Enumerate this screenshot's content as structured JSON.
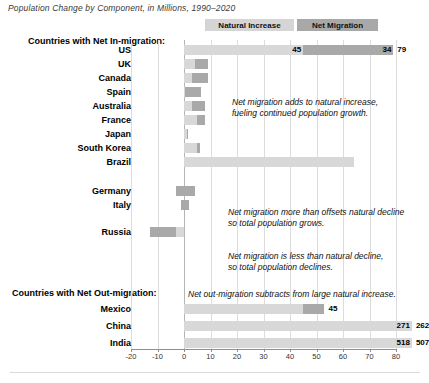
{
  "title": "Population Change by Component, in Millions, 1990–2020",
  "legend": {
    "natural_label": "Natural Increase",
    "migration_label": "Net Migration",
    "natural_color": "#d8d8d8",
    "migration_color": "#a9a9a9"
  },
  "groups": {
    "in_migration_header": "Countries with Net In-migration:",
    "out_migration_header": "Countries with Net Out-migration:"
  },
  "annotations": [
    {
      "line1": "Net migration adds to natural increase,",
      "line2": "fueling continued population growth."
    },
    {
      "line1": "Net migration more than offsets natural decline",
      "line2": "so total population grows."
    },
    {
      "line1": "Net migration is less than natural decline,",
      "line2": "so total population declines."
    },
    {
      "line1": "Net out-migration subtracts from large natural increase.",
      "line2": ""
    }
  ],
  "axis": {
    "ticks": [
      "-20",
      "-10",
      "0",
      "10",
      "20",
      "30",
      "40",
      "50",
      "60",
      "70",
      "80"
    ],
    "min": -20,
    "max": 80
  },
  "chart_data": {
    "type": "bar",
    "title": "Population Change by Component, in Millions, 1990–2020",
    "xlabel": "",
    "ylabel": "",
    "xlim": [
      -20,
      80
    ],
    "grid": true,
    "legend_position": "top",
    "orientation": "horizontal",
    "stacked": true,
    "series": [
      {
        "name": "Natural Increase",
        "color": "#d8d8d8"
      },
      {
        "name": "Net Migration",
        "color": "#a9a9a9"
      }
    ],
    "categories": [
      "US",
      "UK",
      "Canada",
      "Spain",
      "Australia",
      "France",
      "Japan",
      "South Korea",
      "Brazil",
      "Germany",
      "Italy",
      "Russia",
      "Mexico",
      "China",
      "India"
    ],
    "rows": [
      {
        "label": "US",
        "natural": 45,
        "migration": 34,
        "total": 79,
        "natural_label": "45",
        "migration_label": "34",
        "total_label": "79",
        "show_labels": true
      },
      {
        "label": "UK",
        "natural": 4,
        "migration": 5,
        "total": 9,
        "natural_label": "",
        "migration_label": "",
        "total_label": "",
        "show_labels": false
      },
      {
        "label": "Canada",
        "natural": 3,
        "migration": 6,
        "total": 9,
        "natural_label": "",
        "migration_label": "",
        "total_label": "",
        "show_labels": false
      },
      {
        "label": "Spain",
        "natural": 0.5,
        "migration": 6,
        "total": 6.5,
        "natural_label": "",
        "migration_label": "",
        "total_label": "",
        "show_labels": false
      },
      {
        "label": "Australia",
        "natural": 3,
        "migration": 5,
        "total": 8,
        "natural_label": "",
        "migration_label": "",
        "total_label": "",
        "show_labels": false
      },
      {
        "label": "France",
        "natural": 5,
        "migration": 3,
        "total": 8,
        "natural_label": "",
        "migration_label": "",
        "total_label": "",
        "show_labels": false
      },
      {
        "label": "Japan",
        "natural": 1,
        "migration": 0.4,
        "total": 1.4,
        "natural_label": "",
        "migration_label": "",
        "total_label": "",
        "show_labels": false
      },
      {
        "label": "South Korea",
        "natural": 5,
        "migration": 1,
        "total": 6,
        "natural_label": "",
        "migration_label": "",
        "total_label": "",
        "show_labels": false
      },
      {
        "label": "Brazil",
        "natural": 64,
        "migration": 0,
        "total": 64,
        "natural_label": "",
        "migration_label": "",
        "total_label": "",
        "show_labels": false
      },
      {
        "label": "Germany",
        "natural": -3,
        "migration": 7,
        "total": 4,
        "natural_label": "",
        "migration_label": "",
        "total_label": "",
        "show_labels": false
      },
      {
        "label": "Italy",
        "natural": -1,
        "migration": 3,
        "total": 2,
        "natural_label": "",
        "migration_label": "",
        "total_label": "",
        "show_labels": false
      },
      {
        "label": "Russia",
        "natural": -13,
        "migration": 10,
        "total": -3,
        "natural_label": "",
        "migration_label": "",
        "total_label": "",
        "show_labels": false
      },
      {
        "label": "Mexico",
        "natural": 53,
        "migration": -8,
        "total": 45,
        "natural_label": "53",
        "migration_label": "",
        "total_label": "45",
        "show_labels": true
      },
      {
        "label": "China",
        "natural": 271,
        "migration": -9,
        "total": 262,
        "natural_label": "271",
        "migration_label": "",
        "total_label": "262",
        "show_labels": true
      },
      {
        "label": "India",
        "natural": 518,
        "migration": -11,
        "total": 507,
        "natural_label": "518",
        "migration_label": "",
        "total_label": "507",
        "show_labels": true
      }
    ]
  }
}
